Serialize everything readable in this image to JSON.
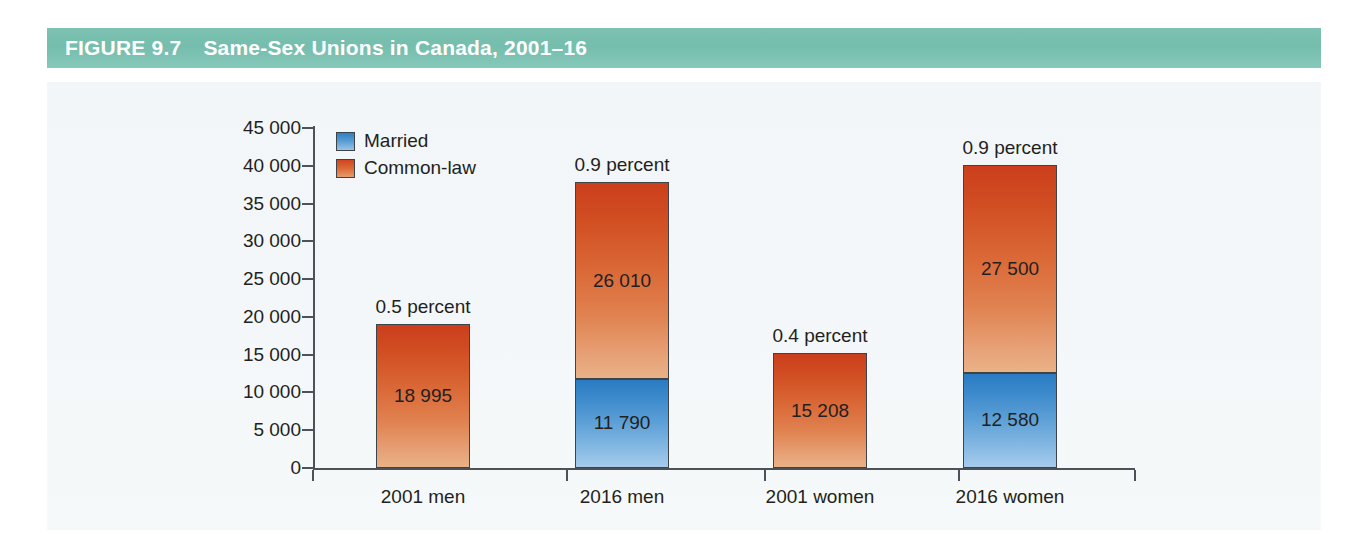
{
  "figure": {
    "label": "FIGURE 9.7",
    "title": "Same-Sex Unions in Canada, 2001–16",
    "band_color": "#7dc2b2",
    "band_text_color": "#ffffff",
    "panel_bg": "#f4f7f9"
  },
  "legend": {
    "position": "top-left-inside-plot",
    "items": [
      {
        "label": "Married",
        "color": "#3d8bcc",
        "swatch": "blue-gradient-swatch"
      },
      {
        "label": "Common-law",
        "color": "#d9632f",
        "swatch": "orange-gradient-swatch"
      }
    ]
  },
  "axes": {
    "y_ticks": [
      "45 000",
      "40 000",
      "35 000",
      "30 000",
      "25 000",
      "20 000",
      "15 000",
      "10 000",
      "5 000",
      "0"
    ],
    "y_values": [
      45000,
      40000,
      35000,
      30000,
      25000,
      20000,
      15000,
      10000,
      5000,
      0
    ],
    "x_categories": [
      "2001 men",
      "2016 men",
      "2001 women",
      "2016 women"
    ],
    "ylabel": "",
    "xlabel": "",
    "grid": false
  },
  "bars": [
    {
      "category": "2001 men",
      "percent_label": "0.5 percent",
      "segments": [
        {
          "series": "Common-law",
          "value": 18995,
          "value_label": "18 995"
        }
      ],
      "total": 18995
    },
    {
      "category": "2016 men",
      "percent_label": "0.9 percent",
      "segments": [
        {
          "series": "Married",
          "value": 11790,
          "value_label": "11 790"
        },
        {
          "series": "Common-law",
          "value": 26010,
          "value_label": "26 010"
        }
      ],
      "total": 37800
    },
    {
      "category": "2001 women",
      "percent_label": "0.4 percent",
      "segments": [
        {
          "series": "Common-law",
          "value": 15208,
          "value_label": "15 208"
        }
      ],
      "total": 15208
    },
    {
      "category": "2016 women",
      "percent_label": "0.9 percent",
      "segments": [
        {
          "series": "Married",
          "value": 12580,
          "value_label": "12 580"
        },
        {
          "series": "Common-law",
          "value": 27500,
          "value_label": "27 500"
        }
      ],
      "total": 40080
    }
  ],
  "chart_data": {
    "type": "bar",
    "stacked": true,
    "title": "Same-Sex Unions in Canada, 2001–16",
    "subtitle": "",
    "xlabel": "",
    "ylabel": "",
    "categories": [
      "2001 men",
      "2016 men",
      "2001 women",
      "2016 women"
    ],
    "series": [
      {
        "name": "Married",
        "color": "#3d8bcc",
        "values": [
          0,
          11790,
          0,
          12580
        ]
      },
      {
        "name": "Common-law",
        "color": "#d9632f",
        "values": [
          18995,
          26010,
          15208,
          27500
        ]
      }
    ],
    "totals": [
      18995,
      37800,
      15208,
      40080
    ],
    "annotations": [
      "0.5 percent",
      "0.9 percent",
      "0.4 percent",
      "0.9 percent"
    ],
    "data_labels": [
      [
        "18 995"
      ],
      [
        "11 790",
        "26 010"
      ],
      [
        "15 208"
      ],
      [
        "12 580",
        "27 500"
      ]
    ],
    "ylim": [
      0,
      45000
    ],
    "ytick_step": 5000,
    "ytick_labels": [
      "0",
      "5 000",
      "10 000",
      "15 000",
      "20 000",
      "25 000",
      "30 000",
      "35 000",
      "40 000",
      "45 000"
    ],
    "grid": false,
    "legend_position": "upper left"
  }
}
